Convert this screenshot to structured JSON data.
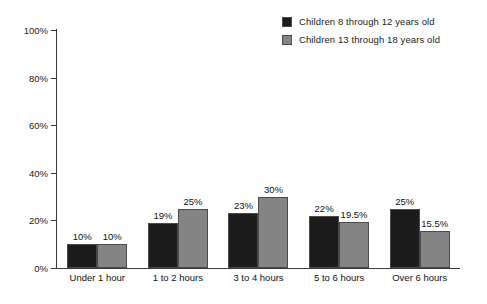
{
  "chart_data": {
    "type": "bar",
    "title": "",
    "subtitle": "",
    "xlabel": "",
    "ylabel": "",
    "ylim": [
      0,
      100
    ],
    "yticks": [
      "0%",
      "20%",
      "40%",
      "60%",
      "80%",
      "100%"
    ],
    "ytick_values": [
      0,
      20,
      40,
      60,
      80,
      100
    ],
    "grid": false,
    "legend_position": "top-right",
    "categories": [
      "Under 1 hour",
      "1 to 2 hours",
      "3 to 4 hours",
      "5 to 6 hours",
      "Over 6 hours"
    ],
    "series": [
      {
        "name": "Children 8 through 12 years old",
        "color": "#1c1c1c",
        "values": [
          10,
          19,
          23,
          22,
          25
        ],
        "labels": [
          "10%",
          "19%",
          "23%",
          "22%",
          "25%"
        ]
      },
      {
        "name": "Children 13 through 18 years old",
        "color": "#848484",
        "values": [
          10,
          25,
          30,
          19.5,
          15.5
        ],
        "labels": [
          "10%",
          "25%",
          "30%",
          "19.5%",
          "15.5%"
        ]
      }
    ]
  },
  "legend": {
    "items": [
      {
        "label": "Children 8 through 12 years old",
        "color": "#1c1c1c"
      },
      {
        "label": "Children 13 through 18 years old",
        "color": "#848484"
      }
    ]
  }
}
